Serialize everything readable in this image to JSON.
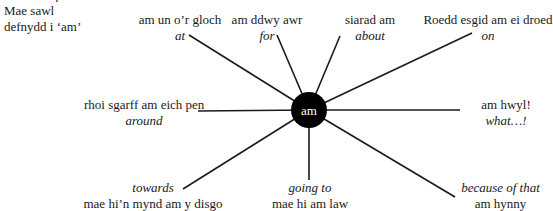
{
  "heading_fragment": "· · ·/ · ·",
  "intro": {
    "line1": "Mae sawl",
    "line2": "defnydd i ‘am’"
  },
  "hub": {
    "label": "am",
    "fill": "#000000",
    "text_color": "#ffffff"
  },
  "spokes": [
    {
      "id": "at",
      "welsh": "am un o’r gloch",
      "english": "at",
      "order": "welsh-first"
    },
    {
      "id": "for",
      "welsh": "am ddwy awr",
      "english": "for",
      "order": "welsh-first"
    },
    {
      "id": "about",
      "welsh": "siarad am",
      "english": "about",
      "order": "welsh-first"
    },
    {
      "id": "on",
      "welsh": "Roedd esgid am ei droed",
      "english": "on",
      "order": "welsh-first"
    },
    {
      "id": "around",
      "welsh": "rhoi sgarff am eich pen",
      "english": "around",
      "order": "welsh-first"
    },
    {
      "id": "what",
      "welsh": "am hwyl!",
      "english": "what…!",
      "order": "welsh-first"
    },
    {
      "id": "towards",
      "welsh": "mae hi’n mynd am y disgo",
      "english": "towards",
      "order": "english-first"
    },
    {
      "id": "going-to",
      "welsh": "mae hi am law",
      "english": "going to",
      "order": "english-first"
    },
    {
      "id": "because-of-that",
      "welsh": "am hynny",
      "english": "because of that",
      "order": "english-first"
    }
  ],
  "colors": {
    "line": "#1a1a1a",
    "text": "#1a1a1a",
    "background": "#ffffff"
  }
}
